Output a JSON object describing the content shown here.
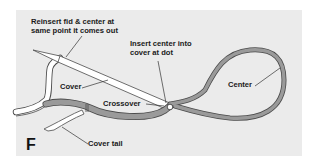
{
  "figure": {
    "letter": "F",
    "background_color": "#ebebeb",
    "rope_colors": {
      "cover": "#ffffff",
      "center": "#9a9a9a",
      "outline": "#4a4a4a"
    }
  },
  "labels": {
    "reinsert_line1": "Reinsert fid & center at",
    "reinsert_line2": "same point it comes out",
    "insert_line1": "Insert center into",
    "insert_line2": "cover at dot",
    "cover": "Cover",
    "crossover": "Crossover",
    "center": "Center",
    "cover_tail": "Cover tail"
  }
}
